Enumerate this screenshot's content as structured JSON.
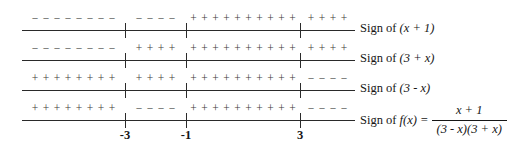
{
  "chart_data": {
    "type": "table",
    "xlabel": "x",
    "ylabel": "",
    "grid": false,
    "legend": "none",
    "axis_range": [
      -6.0,
      6.5
    ],
    "critical_points": [
      {
        "value": -3,
        "label": "-3",
        "x_px": 125
      },
      {
        "value": -1,
        "label": "-1",
        "x_px": 186
      },
      {
        "value": 3,
        "label": "3",
        "x_px": 300
      }
    ],
    "intervals": [
      {
        "name": "x < -3",
        "start_px": 22,
        "end_px": 125
      },
      {
        "name": "-3 < x < -1",
        "start_px": 125,
        "end_px": 186
      },
      {
        "name": "-1 < x < 3",
        "start_px": 186,
        "end_px": 300
      },
      {
        "name": "x > 3",
        "start_px": 300,
        "end_px": 355
      }
    ],
    "rows": [
      {
        "id": "row-1",
        "expression": "(x + 1)",
        "label_prefix": "Sign of ",
        "signs": [
          "-",
          "-",
          "+",
          "+"
        ],
        "counts": [
          8,
          4,
          10,
          4
        ]
      },
      {
        "id": "row-2",
        "expression": "(3 + x)",
        "label_prefix": "Sign of ",
        "signs": [
          "-",
          "+",
          "+",
          "+"
        ],
        "counts": [
          8,
          4,
          10,
          4
        ]
      },
      {
        "id": "row-3",
        "expression": "(3 - x)",
        "label_prefix": "Sign of ",
        "signs": [
          "+",
          "+",
          "+",
          "-"
        ],
        "counts": [
          8,
          4,
          10,
          4
        ]
      },
      {
        "id": "row-4",
        "expression": "f(x) =",
        "label_prefix": "Sign of ",
        "signs": [
          "+",
          "-",
          "+",
          "-"
        ],
        "counts": [
          8,
          4,
          10,
          4
        ],
        "fraction": {
          "numerator": "x + 1",
          "denominator": "(3 - x)(3 + x)"
        }
      }
    ]
  },
  "labels": {
    "row1": {
      "prefix": "Sign of ",
      "expr": "(x + 1)"
    },
    "row2": {
      "prefix": "Sign of ",
      "expr": "(3 + x)"
    },
    "row3": {
      "prefix": "Sign of ",
      "expr": "(3 - x)"
    },
    "row4": {
      "prefix": "Sign of ",
      "expr": "f(x) =",
      "numerator": "x + 1",
      "denominator": "(3 - x)(3 + x)"
    }
  },
  "axis": {
    "tick_labels": [
      "-3",
      "-1",
      "3"
    ]
  },
  "colors": {
    "line": "#2a2a2a",
    "sign_glyph": "#3a3a3a",
    "text": "#161616",
    "background": "#ffffff"
  }
}
